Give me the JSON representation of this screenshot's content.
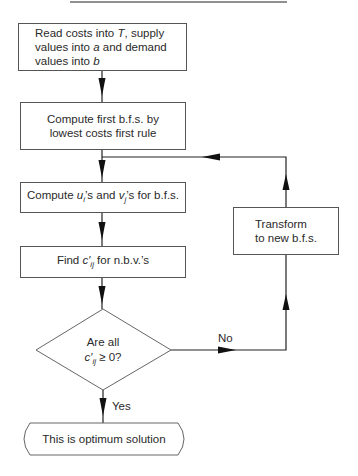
{
  "diagram": {
    "type": "flowchart",
    "title_rule": true,
    "nodes": [
      {
        "id": "read",
        "shape": "process",
        "lines": [
          "Read costs into T, supply",
          "values into a and demand",
          "values into b"
        ]
      },
      {
        "id": "first_bfs",
        "shape": "process",
        "lines": [
          "Compute first b.f.s. by",
          "lowest costs first rule"
        ]
      },
      {
        "id": "compute_uv",
        "shape": "process",
        "text": "Compute u_i's and v_j's for b.f.s."
      },
      {
        "id": "find_c",
        "shape": "process",
        "text": "Find c'_ij for n.b.v.'s"
      },
      {
        "id": "decision",
        "shape": "decision",
        "lines": [
          "Are all",
          "c'_ij ≥ 0?"
        ]
      },
      {
        "id": "transform",
        "shape": "process",
        "lines": [
          "Transform",
          "to new b.f.s."
        ]
      },
      {
        "id": "optimum",
        "shape": "terminal",
        "text": "This is optimum solution"
      }
    ],
    "edges": [
      {
        "from": "read",
        "to": "first_bfs"
      },
      {
        "from": "first_bfs",
        "to": "compute_uv"
      },
      {
        "from": "compute_uv",
        "to": "find_c"
      },
      {
        "from": "find_c",
        "to": "decision"
      },
      {
        "from": "decision",
        "to": "optimum",
        "label": "Yes"
      },
      {
        "from": "decision",
        "to": "transform",
        "label": "No"
      },
      {
        "from": "transform",
        "to": "compute_uv"
      }
    ]
  },
  "text": {
    "read_1a": "Read costs into ",
    "read_1b": "T",
    "read_1c": ", supply",
    "read_2a": "values into ",
    "read_2b": "a",
    "read_2c": " and demand",
    "read_3a": "values into ",
    "read_3b": "b",
    "first_1": "Compute first b.f.s. by",
    "first_2": "lowest costs first rule",
    "uv_a": "Compute ",
    "uv_u": "u",
    "uv_i": "i",
    "uv_b": "’s and ",
    "uv_v": "v",
    "uv_j": "j",
    "uv_c": "’s for b.f.s.",
    "find_a": "Find ",
    "find_c": "c′",
    "find_ij": "ij",
    "find_b": " for n.b.v.’s",
    "dec_1": "Are all",
    "dec_c": "c′",
    "dec_ij": "ij",
    "dec_2": " ≥ 0?",
    "transform_1": "Transform",
    "transform_2": "to new b.f.s.",
    "optimum": "This is optimum solution",
    "yes": "Yes",
    "no": "No"
  }
}
